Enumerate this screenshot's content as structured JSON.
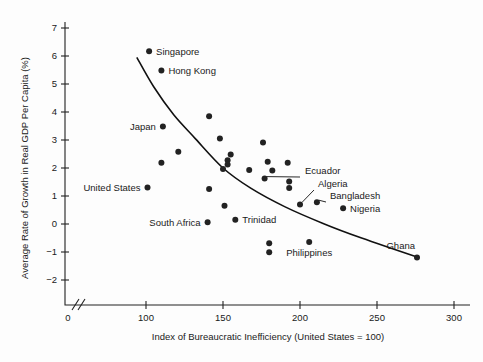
{
  "figure": {
    "title": "",
    "background": "#fdfdfd",
    "ink": "#1a1a1a"
  },
  "chart_data": {
    "type": "scatter",
    "title": "",
    "xlabel": "Index of Bureaucratic Inefficiency (United States = 100)",
    "ylabel": "Average Rate of Growth in Real GDP Per Capita (%)",
    "xlim": [
      90,
      305
    ],
    "ylim": [
      -2.6,
      7.3
    ],
    "grid": false,
    "legend": "none",
    "x_axis_break": true,
    "y_axis_break": true,
    "xticks": [
      0,
      100,
      150,
      200,
      250,
      300
    ],
    "xtick_labels": [
      "0",
      "100",
      "150",
      "200",
      "250",
      "300"
    ],
    "yticks": [
      -2,
      -1,
      0,
      1,
      2,
      3,
      4,
      5,
      6,
      7
    ],
    "ytick_labels": [
      "−2",
      "−1",
      "0",
      "1",
      "2",
      "3",
      "4",
      "5",
      "6",
      "7"
    ],
    "points": [
      {
        "x": 102,
        "y": 6.17,
        "label": "Singapore",
        "label_pos": "right"
      },
      {
        "x": 110,
        "y": 5.48,
        "label": "Hong Kong",
        "label_pos": "right"
      },
      {
        "x": 111,
        "y": 3.48,
        "label": "Japan",
        "label_pos": "left"
      },
      {
        "x": 101,
        "y": 1.3,
        "label": "United States",
        "label_pos": "left"
      },
      {
        "x": 140,
        "y": 0.06,
        "label": "South Africa",
        "label_pos": "left"
      },
      {
        "x": 158,
        "y": 0.15,
        "label": "Trinidad",
        "label_pos": "right"
      },
      {
        "x": 228,
        "y": 0.56,
        "label": "Nigeria",
        "label_pos": "right"
      },
      {
        "x": 276,
        "y": -1.2,
        "label": "Ghana",
        "label_pos": "upright"
      },
      {
        "x": 200,
        "y": 0.7,
        "label": "Algeria",
        "label_pos": "leader"
      },
      {
        "x": 211,
        "y": 0.78,
        "label": "Bangladesh",
        "label_pos": "leader"
      },
      {
        "x": 177,
        "y": 1.62,
        "label": "Ecuador",
        "label_pos": "leader"
      },
      {
        "x": 110,
        "y": 2.19,
        "label": "",
        "label_pos": "none"
      },
      {
        "x": 121,
        "y": 2.58,
        "label": "",
        "label_pos": "none"
      },
      {
        "x": 141,
        "y": 3.85,
        "label": "",
        "label_pos": "none"
      },
      {
        "x": 148,
        "y": 3.05,
        "label": "",
        "label_pos": "none"
      },
      {
        "x": 155,
        "y": 2.48,
        "label": "",
        "label_pos": "none"
      },
      {
        "x": 153,
        "y": 2.28,
        "label": "",
        "label_pos": "none"
      },
      {
        "x": 153,
        "y": 2.12,
        "label": "",
        "label_pos": "none"
      },
      {
        "x": 150,
        "y": 1.96,
        "label": "",
        "label_pos": "none"
      },
      {
        "x": 141,
        "y": 1.25,
        "label": "",
        "label_pos": "none"
      },
      {
        "x": 151,
        "y": 0.65,
        "label": "",
        "label_pos": "none"
      },
      {
        "x": 167,
        "y": 1.93,
        "label": "",
        "label_pos": "none"
      },
      {
        "x": 176,
        "y": 2.91,
        "label": "",
        "label_pos": "none"
      },
      {
        "x": 179,
        "y": 2.22,
        "label": "",
        "label_pos": "none"
      },
      {
        "x": 182,
        "y": 1.91,
        "label": "",
        "label_pos": "none"
      },
      {
        "x": 192,
        "y": 2.19,
        "label": "",
        "label_pos": "none"
      },
      {
        "x": 193,
        "y": 1.52,
        "label": "",
        "label_pos": "none"
      },
      {
        "x": 193,
        "y": 1.29,
        "label": "",
        "label_pos": "none"
      },
      {
        "x": 180,
        "y": -0.69,
        "label": "",
        "label_pos": "none"
      },
      {
        "x": 180,
        "y": -1.01,
        "label": "",
        "label_pos": "none"
      },
      {
        "x": 206,
        "y": -0.64,
        "label": "Philippines",
        "label_pos": "below"
      }
    ],
    "trend_curve": {
      "description": "downward-sloping convex fitted curve",
      "points": [
        {
          "x": 94,
          "y": 5.95
        },
        {
          "x": 105,
          "y": 4.9
        },
        {
          "x": 118,
          "y": 3.9
        },
        {
          "x": 132,
          "y": 3.05
        },
        {
          "x": 150,
          "y": 2.0
        },
        {
          "x": 168,
          "y": 1.28
        },
        {
          "x": 190,
          "y": 0.62
        },
        {
          "x": 215,
          "y": 0.02
        },
        {
          "x": 240,
          "y": -0.5
        },
        {
          "x": 276,
          "y": -1.18
        }
      ]
    },
    "annotations": [
      {
        "text": "Ecuador",
        "anchor_x": 177,
        "anchor_y": 1.62
      },
      {
        "text": "Algeria",
        "anchor_x": 200,
        "anchor_y": 0.7
      },
      {
        "text": "Bangladesh",
        "anchor_x": 211,
        "anchor_y": 0.78
      }
    ]
  }
}
